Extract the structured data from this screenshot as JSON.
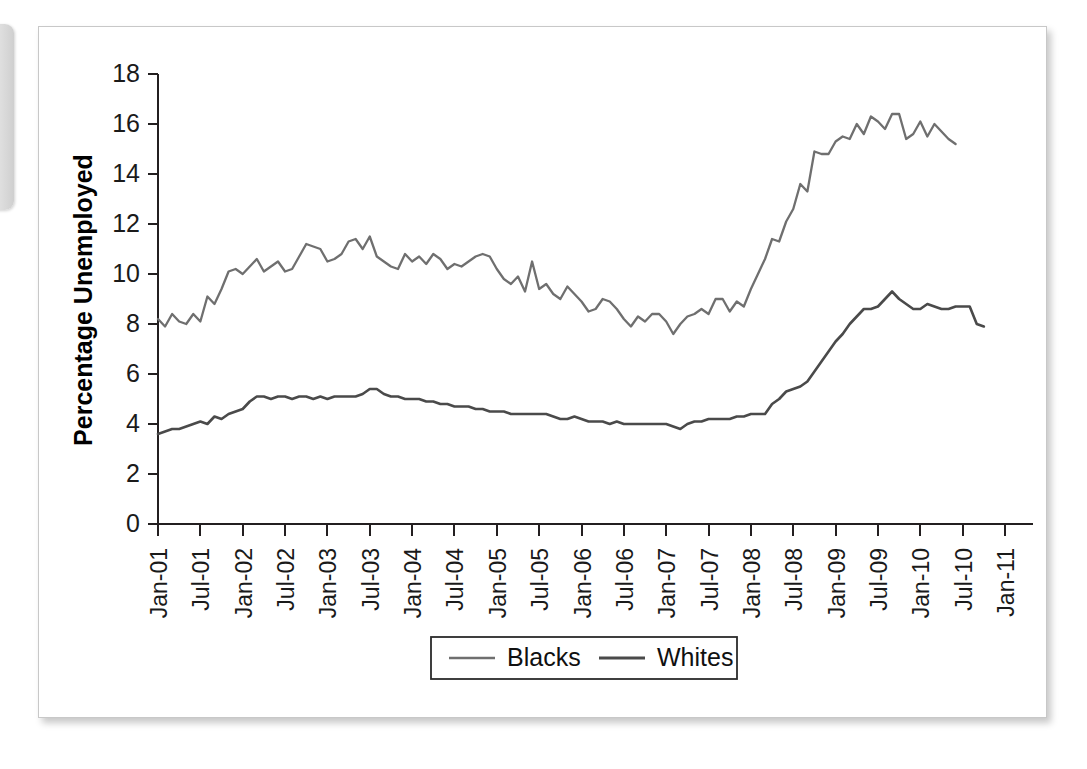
{
  "page": {
    "background_color": "#ffffff",
    "panel_color": "#ffffff",
    "panel_border_color": "#c8c8c8",
    "left_tab_color": "#d9d9d9"
  },
  "chart_data": {
    "type": "line",
    "title": "",
    "xlabel": "",
    "ylabel": "Percentage Unemployed",
    "ylim": [
      0,
      18
    ],
    "ytick_step": 2,
    "ytick_labels": [
      "0",
      "2",
      "4",
      "6",
      "8",
      "10",
      "12",
      "14",
      "16",
      "18"
    ],
    "grid": false,
    "legend_position": "bottom-center",
    "xtick_labels": [
      "Jan-01",
      "Jul-01",
      "Jan-02",
      "Jul-02",
      "Jan-03",
      "Jul-03",
      "Jan-04",
      "Jul-04",
      "Jan-05",
      "Jul-05",
      "Jan-06",
      "Jul-06",
      "Jan-07",
      "Jul-07",
      "Jan-08",
      "Jul-08",
      "Jan-09",
      "Jul-09",
      "Jan-10",
      "Jul-10",
      "Jan-11"
    ],
    "x_start": "Jan-01",
    "x_end": "Feb-11",
    "x_interval": "monthly",
    "series": [
      {
        "name": "Blacks",
        "color": "#6f6f6f",
        "values": [
          8.2,
          7.9,
          8.4,
          8.1,
          8.0,
          8.4,
          8.1,
          9.1,
          8.8,
          9.4,
          10.1,
          10.2,
          10.0,
          10.3,
          10.6,
          10.1,
          10.3,
          10.5,
          10.1,
          10.2,
          10.7,
          11.2,
          11.1,
          11.0,
          10.5,
          10.6,
          10.8,
          11.3,
          11.4,
          11.0,
          11.5,
          10.7,
          10.5,
          10.3,
          10.2,
          10.8,
          10.5,
          10.7,
          10.4,
          10.8,
          10.6,
          10.2,
          10.4,
          10.3,
          10.5,
          10.7,
          10.8,
          10.7,
          10.2,
          9.8,
          9.6,
          9.9,
          9.3,
          10.5,
          9.4,
          9.6,
          9.2,
          9.0,
          9.5,
          9.2,
          8.9,
          8.5,
          8.6,
          9.0,
          8.9,
          8.6,
          8.2,
          7.9,
          8.3,
          8.1,
          8.4,
          8.4,
          8.1,
          7.6,
          8.0,
          8.3,
          8.4,
          8.6,
          8.4,
          9.0,
          9.0,
          8.5,
          8.9,
          8.7,
          9.4,
          10.0,
          10.6,
          11.4,
          11.3,
          12.1,
          12.6,
          13.6,
          13.3,
          14.9,
          14.8,
          14.8,
          15.3,
          15.5,
          15.4,
          16.0,
          15.6,
          16.3,
          16.1,
          15.8,
          16.4,
          16.4,
          15.4,
          15.6,
          16.1,
          15.5,
          16.0,
          15.7,
          15.4,
          15.2
        ]
      },
      {
        "name": "Whites",
        "color": "#4a4a4a",
        "values": [
          3.6,
          3.7,
          3.8,
          3.8,
          3.9,
          4.0,
          4.1,
          4.0,
          4.3,
          4.2,
          4.4,
          4.5,
          4.6,
          4.9,
          5.1,
          5.1,
          5.0,
          5.1,
          5.1,
          5.0,
          5.1,
          5.1,
          5.0,
          5.1,
          5.0,
          5.1,
          5.1,
          5.1,
          5.1,
          5.2,
          5.4,
          5.4,
          5.2,
          5.1,
          5.1,
          5.0,
          5.0,
          5.0,
          4.9,
          4.9,
          4.8,
          4.8,
          4.7,
          4.7,
          4.7,
          4.6,
          4.6,
          4.5,
          4.5,
          4.5,
          4.4,
          4.4,
          4.4,
          4.4,
          4.4,
          4.4,
          4.3,
          4.2,
          4.2,
          4.3,
          4.2,
          4.1,
          4.1,
          4.1,
          4.0,
          4.1,
          4.0,
          4.0,
          4.0,
          4.0,
          4.0,
          4.0,
          4.0,
          3.9,
          3.8,
          4.0,
          4.1,
          4.1,
          4.2,
          4.2,
          4.2,
          4.2,
          4.3,
          4.3,
          4.4,
          4.4,
          4.4,
          4.8,
          5.0,
          5.3,
          5.4,
          5.5,
          5.7,
          6.1,
          6.5,
          6.9,
          7.3,
          7.6,
          8.0,
          8.3,
          8.6,
          8.6,
          8.7,
          9.0,
          9.3,
          9.0,
          8.8,
          8.6,
          8.6,
          8.8,
          8.7,
          8.6,
          8.6,
          8.7,
          8.7,
          8.7,
          8.0,
          7.9
        ]
      }
    ]
  },
  "legend": {
    "items": [
      {
        "label": "Blacks",
        "color": "#6f6f6f"
      },
      {
        "label": "Whites",
        "color": "#4a4a4a"
      }
    ]
  }
}
